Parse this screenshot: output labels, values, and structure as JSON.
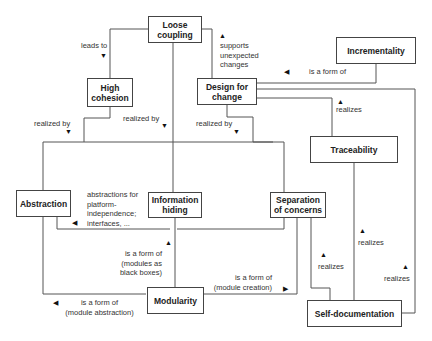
{
  "nodes": {
    "loose_coupling": "Loose\ncoupling",
    "high_cohesion": "High\ncohesion",
    "design_for_change": "Design for\nchange",
    "incrementality": "Incrementality",
    "traceability": "Traceability",
    "abstraction": "Abstraction",
    "information_hiding": "Information\nhiding",
    "separation_of_concerns": "Separation\nof concerns",
    "modularity": "Modularity",
    "self_documentation": "Self-documentation"
  },
  "edges": {
    "leads_to": "leads to",
    "realized_by_1": "realized by",
    "realized_by_2": "realized by",
    "realized_by_3": "realized by",
    "supports_unexpected_changes": "supports\nunexpected\nchanges",
    "is_a_form_of_incrementality": "is a form of",
    "realizes_traceability": "realizes",
    "abstractions_for": "abstractions for\nplatform-\nindependence;\ninterfaces, ...",
    "is_a_form_of_black_boxes": "is a form of\n(modules as\nblack boxes)",
    "is_a_form_of_module_creation": "is a form of\n(module creation)",
    "is_a_form_of_module_abstraction": "is a form of\n(module abstraction)",
    "realizes_soc": "realizes",
    "realizes_trace_selfdoc": "realizes",
    "realizes_selfdoc_dfc": "realizes"
  },
  "arrows": {
    "down": "▼",
    "up": "▲",
    "left": "◀",
    "right": "▶"
  }
}
